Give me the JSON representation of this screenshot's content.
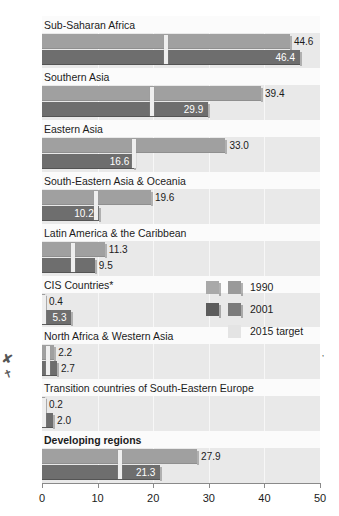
{
  "chart_data": {
    "type": "bar",
    "orientation": "horizontal",
    "title": "",
    "subtitle": "",
    "xlabel": "",
    "ylabel": "",
    "xlim": [
      0,
      50
    ],
    "xticks": [
      0,
      10,
      20,
      30,
      40,
      50
    ],
    "xticklabels": [
      "0",
      "10",
      "20",
      "30",
      "40",
      "50"
    ],
    "grid": true,
    "grid_axis": "x",
    "legend_position": "middle-right",
    "categories": [
      "Sub-Saharan Africa",
      "Southern Asia",
      "Eastern Asia",
      "South-Eastern Asia & Oceania",
      "Latin America & the Caribbean",
      "CIS Countries*",
      "North Africa & Western Asia",
      "Transition countries of South-Eastern Europe",
      "Developing regions"
    ],
    "series": [
      {
        "name": "1990",
        "color": "#a0a0a0",
        "values": [
          44.6,
          39.4,
          33.0,
          19.6,
          11.3,
          0.4,
          2.2,
          0.2,
          27.9
        ]
      },
      {
        "name": "2001",
        "color": "#6e6e6e",
        "values": [
          46.4,
          29.9,
          16.6,
          10.2,
          9.5,
          5.3,
          2.7,
          2.0,
          21.3
        ]
      },
      {
        "name": "2015 target",
        "color": "#efefef",
        "marker": "vertical-tick",
        "values": [
          22.3,
          19.7,
          16.5,
          9.8,
          5.65,
          0.2,
          1.1,
          0.1,
          13.95
        ]
      }
    ],
    "rows": [
      {
        "label": "Sub-Saharan Africa",
        "bold": false,
        "v1990": 44.6,
        "v2001": 46.4,
        "target": 22.3,
        "label_1990": "44.6",
        "label_2001": "46.4",
        "label_1990_placement": "outside",
        "label_2001_placement": "inside"
      },
      {
        "label": "Southern Asia",
        "bold": false,
        "v1990": 39.4,
        "v2001": 29.9,
        "target": 19.7,
        "label_1990": "39.4",
        "label_2001": "29.9",
        "label_1990_placement": "outside",
        "label_2001_placement": "inside"
      },
      {
        "label": "Eastern Asia",
        "bold": false,
        "v1990": 33.0,
        "v2001": 16.6,
        "target": 16.5,
        "label_1990": "33.0",
        "label_2001": "16.6",
        "label_1990_placement": "outside",
        "label_2001_placement": "inside"
      },
      {
        "label": "South-Eastern Asia & Oceania",
        "bold": false,
        "v1990": 19.6,
        "v2001": 10.2,
        "target": 9.8,
        "label_1990": "19.6",
        "label_2001": "10.2",
        "label_1990_placement": "outside",
        "label_2001_placement": "inside"
      },
      {
        "label": "Latin America & the Caribbean",
        "bold": false,
        "v1990": 11.3,
        "v2001": 9.5,
        "target": 5.65,
        "label_1990": "11.3",
        "label_2001": "9.5",
        "label_1990_placement": "outside",
        "label_2001_placement": "outside"
      },
      {
        "label": "CIS Countries*",
        "bold": false,
        "v1990": 0.4,
        "v2001": 5.3,
        "target": 0.2,
        "label_1990": "0.4",
        "label_2001": "5.3",
        "label_1990_placement": "outside",
        "label_2001_placement": "inside"
      },
      {
        "label": "North Africa & Western Asia",
        "bold": false,
        "v1990": 2.2,
        "v2001": 2.7,
        "target": 1.1,
        "label_1990": "2.2",
        "label_2001": "2.7",
        "label_1990_placement": "outside",
        "label_2001_placement": "outside"
      },
      {
        "label": "Transition countries of South-Eastern Europe",
        "bold": false,
        "v1990": 0.2,
        "v2001": 2.0,
        "target": 0.1,
        "label_1990": "0.2",
        "label_2001": "2.0",
        "label_1990_placement": "outside",
        "label_2001_placement": "outside"
      },
      {
        "label": "Developing regions",
        "bold": true,
        "v1990": 27.9,
        "v2001": 21.3,
        "target": 13.95,
        "label_1990": "27.9",
        "label_2001": "21.3",
        "label_1990_placement": "outside",
        "label_2001_placement": "inside"
      }
    ]
  },
  "legend": {
    "items": [
      {
        "label": "1990"
      },
      {
        "label": "2001"
      },
      {
        "label": "2015 target"
      }
    ]
  },
  "axis": {
    "ticklabels": [
      "0",
      "10",
      "20",
      "30",
      "40",
      "50"
    ]
  }
}
